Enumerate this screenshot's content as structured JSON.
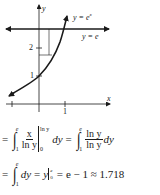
{
  "graph": {
    "curve_label": "y = e",
    "curve_label_sup": "x",
    "line_label": "y = e",
    "y_axis_label": "y",
    "x_axis_label": "x",
    "y_ticks": [
      "1",
      "2"
    ],
    "x_ticks": [
      "1"
    ]
  },
  "equations": {
    "line1": {
      "eq": "=",
      "upper": "e",
      "lower": "1",
      "frac_num": "x",
      "frac_den": "ln y",
      "bar_upper": "ln y",
      "bar_lower": "0",
      "dy": "dy",
      "eq2": "=",
      "upper2": "e",
      "lower2": "1",
      "frac2_num": "ln y",
      "frac2_den": "ln y",
      "dy2": "dy"
    },
    "line2": {
      "eq": "=",
      "upper": "e",
      "lower": "1",
      "dy": "dy",
      "eq2": "=",
      "y": "y",
      "bar_upper": "e",
      "bar_lower": "0",
      "eq3": "=",
      "result": "e − 1 ≈ 1.718"
    }
  }
}
